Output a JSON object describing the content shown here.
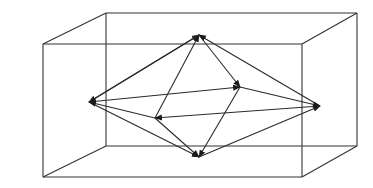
{
  "diagram": {
    "colors": {
      "stroke": "#2a2a2a",
      "background": "#ffffff"
    },
    "box": {
      "back_face": {
        "tl": [
          106,
          13
        ],
        "tr": [
          357,
          13
        ],
        "br": [
          357,
          146
        ],
        "bl": [
          106,
          146
        ]
      },
      "front_face": {
        "tl": [
          43,
          44
        ],
        "tr": [
          302,
          44
        ],
        "br": [
          302,
          177
        ],
        "bl": [
          43,
          177
        ]
      }
    },
    "vertices": {
      "top": [
        199,
        35
      ],
      "left": [
        89,
        102
      ],
      "right": [
        320,
        106
      ],
      "bottom": [
        199,
        157
      ],
      "inner_left": [
        155,
        118
      ],
      "inner_right": [
        240,
        87
      ]
    },
    "edges": [
      {
        "from": "left",
        "to": "top"
      },
      {
        "from": "right",
        "to": "top"
      },
      {
        "from": "inner_left",
        "to": "top"
      },
      {
        "from": "top",
        "to": "inner_right"
      },
      {
        "from": "top",
        "to": "left"
      },
      {
        "from": "inner_right",
        "to": "right"
      },
      {
        "from": "left",
        "to": "inner_right"
      },
      {
        "from": "right",
        "to": "inner_left"
      },
      {
        "from": "inner_right",
        "to": "bottom"
      },
      {
        "from": "inner_left",
        "to": "bottom"
      },
      {
        "from": "bottom",
        "to": "right"
      },
      {
        "from": "left",
        "to": "bottom"
      },
      {
        "from": "inner_left",
        "to": "left"
      }
    ]
  }
}
